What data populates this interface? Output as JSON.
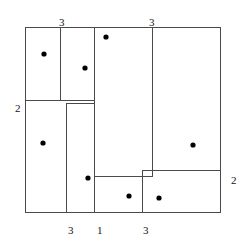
{
  "figure": {
    "kind": "rectangle-partition-diagram",
    "canvas": {
      "width": 241,
      "height": 239
    },
    "outer_rectangle": {
      "x": 25,
      "y": 27,
      "width": 195,
      "height": 185
    },
    "stroke_color": "#4a4a4a",
    "stroke_width": 1,
    "point_color": "#000000",
    "point_radius": 2.6
  },
  "chart_data": {
    "type": "diagram",
    "outer_rectangle": {
      "x": 25,
      "y": 27,
      "width": 195,
      "height": 185
    },
    "cells": [
      {
        "id": "cell-top-left",
        "x": 25,
        "y": 27,
        "width": 35,
        "height": 73
      },
      {
        "id": "cell-top-mid-left",
        "x": 60,
        "y": 27,
        "width": 34,
        "height": 76
      },
      {
        "id": "cell-center-tall",
        "x": 94,
        "y": 27,
        "width": 58,
        "height": 149
      },
      {
        "id": "cell-right-tall",
        "x": 152,
        "y": 27,
        "width": 68,
        "height": 143
      },
      {
        "id": "cell-mid-left",
        "x": 25,
        "y": 100,
        "width": 41,
        "height": 112
      },
      {
        "id": "cell-mid-center",
        "x": 66,
        "y": 103,
        "width": 28,
        "height": 109
      },
      {
        "id": "cell-bottom-mid",
        "x": 94,
        "y": 176,
        "width": 48,
        "height": 36
      },
      {
        "id": "cell-bottom-right",
        "x": 142,
        "y": 170,
        "width": 78,
        "height": 42
      }
    ],
    "segments": [
      {
        "id": "outer-top",
        "x1": 25,
        "y1": 27,
        "x2": 220,
        "y2": 27
      },
      {
        "id": "outer-bottom",
        "x1": 25,
        "y1": 212,
        "x2": 220,
        "y2": 212
      },
      {
        "id": "outer-left",
        "x1": 25,
        "y1": 27,
        "x2": 25,
        "y2": 212
      },
      {
        "id": "outer-right",
        "x1": 220,
        "y1": 27,
        "x2": 220,
        "y2": 212
      },
      {
        "id": "div-v-top-left",
        "x1": 60,
        "y1": 27,
        "x2": 60,
        "y2": 100
      },
      {
        "id": "div-h-upper-left",
        "x1": 25,
        "y1": 100,
        "x2": 94,
        "y2": 100
      },
      {
        "id": "div-h-upper-mid",
        "x1": 66,
        "y1": 103,
        "x2": 94,
        "y2": 103
      },
      {
        "id": "div-v-mid-left",
        "x1": 66,
        "y1": 103,
        "x2": 66,
        "y2": 212
      },
      {
        "id": "div-v-center",
        "x1": 94,
        "y1": 27,
        "x2": 94,
        "y2": 212
      },
      {
        "id": "div-v-right",
        "x1": 152,
        "y1": 27,
        "x2": 152,
        "y2": 176
      },
      {
        "id": "div-h-lower-mid",
        "x1": 94,
        "y1": 176,
        "x2": 152,
        "y2": 176
      },
      {
        "id": "div-h-lower-right",
        "x1": 142,
        "y1": 170,
        "x2": 220,
        "y2": 170
      },
      {
        "id": "div-v-bottom",
        "x1": 142,
        "y1": 170,
        "x2": 142,
        "y2": 212
      }
    ],
    "points": [
      {
        "id": "point-1",
        "x": 44,
        "y": 54
      },
      {
        "id": "point-2",
        "x": 85,
        "y": 68
      },
      {
        "id": "point-3",
        "x": 106,
        "y": 37
      },
      {
        "id": "point-4",
        "x": 43,
        "y": 143
      },
      {
        "id": "point-5",
        "x": 193,
        "y": 145
      },
      {
        "id": "point-6",
        "x": 88,
        "y": 178
      },
      {
        "id": "point-7",
        "x": 129,
        "y": 196
      },
      {
        "id": "point-8",
        "x": 159,
        "y": 198
      }
    ],
    "labels": [
      {
        "id": "label-top-left",
        "text": "3",
        "x": 59,
        "y": 17,
        "side": "top"
      },
      {
        "id": "label-top-right",
        "text": "3",
        "x": 149,
        "y": 17,
        "side": "top"
      },
      {
        "id": "label-left",
        "text": "2",
        "x": 15,
        "y": 103,
        "side": "left"
      },
      {
        "id": "label-right",
        "text": "2",
        "x": 231,
        "y": 175,
        "side": "right"
      },
      {
        "id": "label-bottom-left",
        "text": "3",
        "x": 68,
        "y": 225,
        "side": "bottom"
      },
      {
        "id": "label-bottom-mid",
        "text": "1",
        "x": 97,
        "y": 225,
        "side": "bottom"
      },
      {
        "id": "label-bottom-right",
        "text": "3",
        "x": 143,
        "y": 225,
        "side": "bottom"
      }
    ]
  }
}
